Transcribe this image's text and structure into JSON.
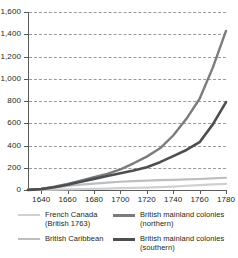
{
  "chart_data": {
    "type": "line",
    "title": "",
    "subtitle": "",
    "xlabel": "",
    "ylabel": "",
    "xlim": [
      1630,
      1780
    ],
    "ylim": [
      0,
      1600
    ],
    "grid": true,
    "grid_style": "dashed-horizontal",
    "legend_position": "bottom",
    "xticks": [
      1640,
      1660,
      1680,
      1700,
      1720,
      1740,
      1760,
      1780
    ],
    "xtick_labels": [
      "1640",
      "1660",
      "1680",
      "1700",
      "1720",
      "1740",
      "1760",
      "1780"
    ],
    "yticks": [
      0,
      200,
      400,
      600,
      800,
      1000,
      1200,
      1400,
      1600
    ],
    "ytick_labels": [
      "0",
      "200",
      "400",
      "600",
      "800",
      "1,000",
      "1,200",
      "1,400",
      "1,600"
    ],
    "x": [
      1630,
      1640,
      1650,
      1660,
      1670,
      1680,
      1690,
      1700,
      1710,
      1720,
      1730,
      1740,
      1750,
      1760,
      1770,
      1780
    ],
    "series": [
      {
        "name": "French Canada (British 1763)",
        "color": "#cfd0d2",
        "width": 2.2,
        "values": [
          0,
          2,
          3,
          5,
          7,
          10,
          13,
          16,
          19,
          22,
          26,
          31,
          38,
          44,
          50,
          55
        ]
      },
      {
        "name": "British Caribbean",
        "color": "#bcbec0",
        "width": 2.2,
        "values": [
          4,
          10,
          22,
          36,
          48,
          58,
          66,
          74,
          80,
          84,
          88,
          91,
          95,
          99,
          104,
          110
        ]
      },
      {
        "name": "British mainland colonies (northern)",
        "color": "#7b7c7f",
        "width": 2.4,
        "values": [
          1,
          10,
          30,
          55,
          85,
          115,
          145,
          185,
          240,
          300,
          375,
          490,
          640,
          820,
          1100,
          1430
        ]
      },
      {
        "name": "British mainland colonies (southern)",
        "color": "#4d4e50",
        "width": 2.6,
        "values": [
          1,
          8,
          25,
          48,
          75,
          100,
          125,
          150,
          175,
          205,
          250,
          305,
          360,
          430,
          590,
          790
        ]
      }
    ]
  },
  "legend": {
    "rows": [
      [
        {
          "label": "French Canada\n(British 1763)",
          "color": "#cfd0d2",
          "weight": "thin",
          "series_index": 0
        },
        {
          "label": "British mainland colonies (northern)",
          "color": "#7b7c7f",
          "weight": "thick",
          "series_index": 2
        }
      ],
      [
        {
          "label": "British Caribbean",
          "color": "#bcbec0",
          "weight": "thin",
          "series_index": 1
        },
        {
          "label": "British mainland colonies (southern)",
          "color": "#4d4e50",
          "weight": "thick",
          "series_index": 3
        }
      ]
    ]
  },
  "colors": {
    "axis": "#58595b",
    "grid": "#9a9a9a",
    "text": "#231f20",
    "background": "#ffffff"
  }
}
